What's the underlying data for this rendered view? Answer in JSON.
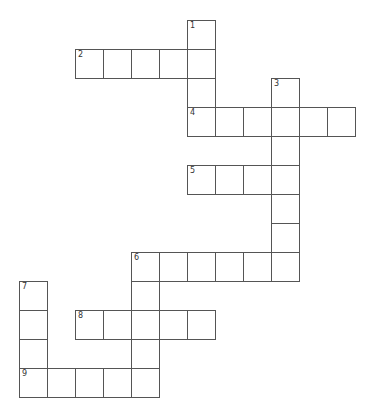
{
  "puzzle": {
    "origin": {
      "x": 19,
      "y": 20
    },
    "cell_w": 28,
    "cell_h": 29,
    "words": [
      {
        "number": "1",
        "direction": "down",
        "col": 6,
        "row": 0,
        "length": 4
      },
      {
        "number": "2",
        "direction": "across",
        "col": 2,
        "row": 1,
        "length": 5
      },
      {
        "number": "3",
        "direction": "down",
        "col": 9,
        "row": 2,
        "length": 7
      },
      {
        "number": "4",
        "direction": "across",
        "col": 6,
        "row": 3,
        "length": 6
      },
      {
        "number": "5",
        "direction": "across",
        "col": 6,
        "row": 5,
        "length": 4
      },
      {
        "number": "6",
        "direction": "across",
        "col": 4,
        "row": 8,
        "length": 6
      },
      {
        "number": "6",
        "direction": "down",
        "col": 4,
        "row": 8,
        "length": 5
      },
      {
        "number": "7",
        "direction": "down",
        "col": 0,
        "row": 9,
        "length": 4
      },
      {
        "number": "8",
        "direction": "across",
        "col": 2,
        "row": 10,
        "length": 5
      },
      {
        "number": "9",
        "direction": "across",
        "col": 0,
        "row": 12,
        "length": 5
      }
    ]
  }
}
